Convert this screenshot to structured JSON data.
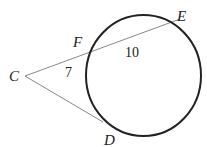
{
  "diagram": {
    "type": "circle-secant-tangent",
    "points": {
      "C": {
        "label": "C",
        "x": 25,
        "y": 76,
        "label_x": 9,
        "label_y": 81
      },
      "F": {
        "label": "F",
        "x": 89,
        "y": 53,
        "label_x": 73,
        "label_y": 47
      },
      "E": {
        "label": "E",
        "x": 180,
        "y": 19,
        "label_x": 177,
        "label_y": 21
      },
      "D": {
        "label": "D",
        "x": 103,
        "y": 122,
        "label_x": 104,
        "label_y": 145
      }
    },
    "segment_labels": {
      "CF": {
        "text": "7",
        "x": 65,
        "y": 77
      },
      "FE": {
        "text": "10",
        "x": 125,
        "y": 57
      }
    },
    "circle": {
      "cx": 143.5,
      "cy": 75.5,
      "rx": 57.5,
      "ry": 60.5
    },
    "colors": {
      "circle_stroke": "#222222",
      "line_stroke": "#888888",
      "text": "#222222"
    }
  }
}
